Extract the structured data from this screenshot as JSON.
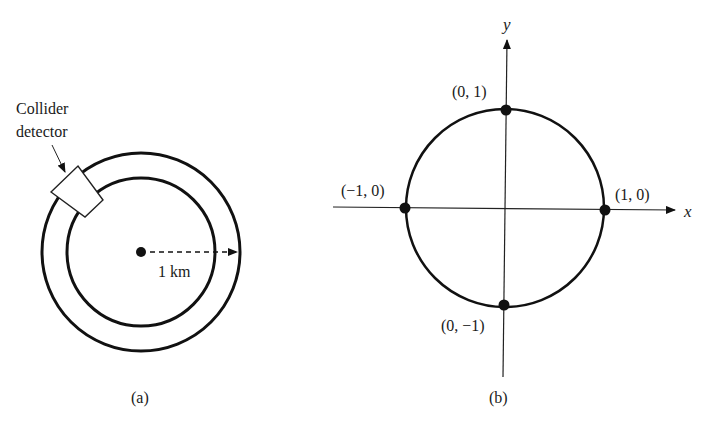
{
  "figure_a": {
    "detector_label_line1": "Collider",
    "detector_label_line2": "detector",
    "radius_label": "1 km",
    "caption": "(a)"
  },
  "figure_b": {
    "x_axis_label": "x",
    "y_axis_label": "y",
    "points": [
      {
        "label": "(0, 1)"
      },
      {
        "label": "(−1, 0)"
      },
      {
        "label": "(1, 0)"
      },
      {
        "label": "(0, −1)"
      }
    ],
    "caption": "(b)"
  },
  "colors": {
    "ink": "#111111",
    "background": "#ffffff"
  }
}
